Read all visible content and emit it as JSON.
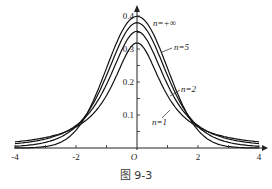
{
  "chart_data": {
    "type": "line",
    "title": "",
    "caption": "图 9-3",
    "xlabel": "",
    "ylabel": "",
    "xlim": [
      -4,
      4
    ],
    "ylim": [
      0,
      0.4
    ],
    "x_ticks": [
      "-4",
      "-2",
      "O",
      "2",
      "4"
    ],
    "y_ticks": [
      "0.1",
      "0.2",
      "0.3",
      "0.4"
    ],
    "grid": false,
    "series": [
      {
        "name": "n=+∞",
        "peak": 0.399,
        "dof": "inf"
      },
      {
        "name": "n=5",
        "peak": 0.38,
        "dof": 5
      },
      {
        "name": "n=2",
        "peak": 0.354,
        "dof": 2
      },
      {
        "name": "n=1",
        "peak": 0.318,
        "dof": 1
      }
    ]
  },
  "labels": {
    "n_inf": "n=+∞",
    "n5": "n=5",
    "n2": "n=2",
    "n1": "n=1"
  }
}
